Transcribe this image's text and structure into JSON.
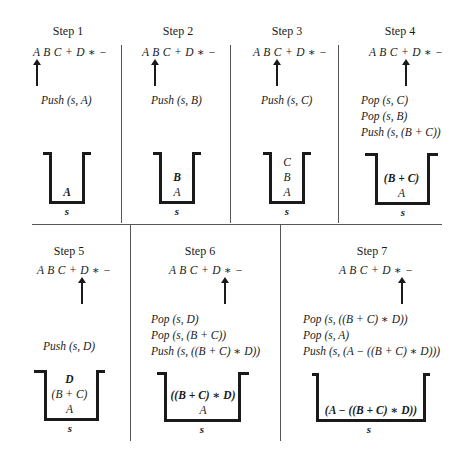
{
  "expression": "A B C + D ∗ −",
  "stack_name": "s",
  "steps": [
    {
      "title": "Step 1",
      "operations": [
        "Push (s, A)"
      ],
      "stack": [
        {
          "text": "A",
          "bold": true
        }
      ]
    },
    {
      "title": "Step 2",
      "operations": [
        "Push (s, B)"
      ],
      "stack": [
        {
          "text": "B",
          "bold": true
        },
        {
          "text": "A",
          "bold": false
        }
      ]
    },
    {
      "title": "Step 3",
      "operations": [
        "Push (s, C)"
      ],
      "stack": [
        {
          "text": "C",
          "bold": false
        },
        {
          "text": "B",
          "bold": false
        },
        {
          "text": "A",
          "bold": false
        }
      ]
    },
    {
      "title": "Step 4",
      "operations": [
        "Pop (s, C)",
        "Pop (s, B)",
        "Push (s, (B + C))"
      ],
      "stack": [
        {
          "text": "(B + C)",
          "bold": true
        },
        {
          "text": "A",
          "bold": false
        }
      ]
    },
    {
      "title": "Step 5",
      "operations": [
        "Push (s, D)"
      ],
      "stack": [
        {
          "text": "D",
          "bold": true
        },
        {
          "text": "(B + C)",
          "bold": false
        },
        {
          "text": "A",
          "bold": false
        }
      ]
    },
    {
      "title": "Step 6",
      "operations": [
        "Pop (s, D)",
        "Pop (s, (B + C))",
        "Push (s, ((B + C) ∗ D))"
      ],
      "stack": [
        {
          "text": "((B + C) ∗ D)",
          "bold": true
        },
        {
          "text": "A",
          "bold": false
        }
      ]
    },
    {
      "title": "Step 7",
      "operations": [
        "Pop (s, ((B + C) ∗ D))",
        "Pop (s, A)",
        "Push (s, (A − ((B + C) ∗ D)))"
      ],
      "stack": [
        {
          "text": "(A − ((B + C) ∗ D))",
          "bold": true
        }
      ]
    }
  ]
}
